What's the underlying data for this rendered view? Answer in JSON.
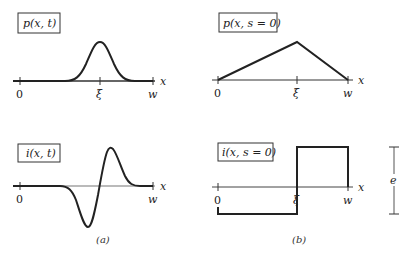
{
  "panels": {
    "a_top": {
      "label": "p(x, t)",
      "axis_label": "x",
      "ticks": [
        "0",
        "ξ",
        "w"
      ],
      "curve": "gaussian-bump"
    },
    "b_top": {
      "label": "p(x, s = 0)",
      "axis_label": "x",
      "ticks": [
        "0",
        "ξ",
        "w"
      ],
      "curve": "triangle"
    },
    "a_bottom": {
      "label": "i(x, t)",
      "axis_label": "x",
      "ticks": [
        "0",
        "w"
      ],
      "curve": "gaussian-derivative"
    },
    "b_bottom": {
      "label": "i(x, s = 0)",
      "axis_label": "x",
      "ticks": [
        "0",
        "ξ",
        "w"
      ],
      "curve": "step",
      "scale_label": "e"
    }
  },
  "captions": {
    "a": "(a)",
    "b": "(b)"
  },
  "colors": {
    "line": "#222222",
    "axis": "#333333"
  }
}
